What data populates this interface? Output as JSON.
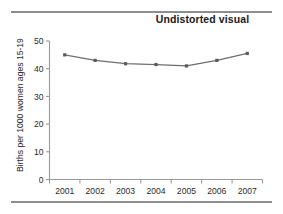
{
  "figure": {
    "title": "Undistorted visual",
    "background_color": "#ffffff",
    "rule_color": "#8e8e8e"
  },
  "chart_data": {
    "type": "line",
    "title": "Undistorted visual",
    "xlabel": "",
    "ylabel": "Births per 1000 women ages 15-19",
    "categories": [
      "2001",
      "2002",
      "2003",
      "2004",
      "2005",
      "2006",
      "2007"
    ],
    "values": [
      45.0,
      43.0,
      41.8,
      41.5,
      41.0,
      43.0,
      45.5
    ],
    "series": [
      {
        "name": "Births per 1000 women ages 15-19",
        "values": [
          45.0,
          43.0,
          41.8,
          41.5,
          41.0,
          43.0,
          45.5
        ]
      }
    ],
    "ylim": [
      0,
      50
    ],
    "ytick_labels": [
      "0",
      "10",
      "20",
      "30",
      "40",
      "50"
    ],
    "ytick_values": [
      0,
      10,
      20,
      30,
      40,
      50
    ],
    "xtick_labels": [
      "2001",
      "2002",
      "2003",
      "2004",
      "2005",
      "2006",
      "2007"
    ],
    "grid": false,
    "legend": "none",
    "line_color": "#6e6e6e",
    "marker_color": "#5a5a5a",
    "marker": "square",
    "axis_color": "#9a9a9a"
  }
}
